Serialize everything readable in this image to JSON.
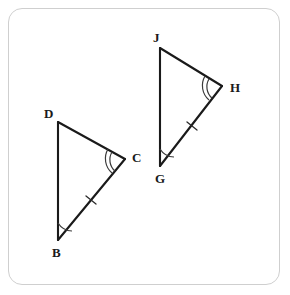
{
  "figure": {
    "name": "congruent-triangles-diagram",
    "border_color": "#cfcfcf",
    "line_color": "#1a1a1a",
    "background_color": "#ffffff",
    "triangles": [
      {
        "id": "triangle-bcd",
        "name": "Triangle BCD",
        "vertices": [
          {
            "label": "D",
            "x": 58,
            "y": 122,
            "label_x": 44,
            "label_y": 118
          },
          {
            "label": "C",
            "x": 125,
            "y": 159,
            "label_x": 132,
            "label_y": 162
          },
          {
            "label": "B",
            "x": 58,
            "y": 240,
            "label_x": 52,
            "label_y": 257
          }
        ],
        "sides": [
          {
            "id": "side-dc",
            "from": "D",
            "to": "C",
            "ticks": 0
          },
          {
            "id": "side-cb",
            "from": "C",
            "to": "B",
            "ticks": 1
          },
          {
            "id": "side-bd",
            "from": "B",
            "to": "D",
            "ticks": 0
          }
        ],
        "angles": [
          {
            "id": "angle-c",
            "vertex": "C",
            "arcs": 2
          },
          {
            "id": "angle-b",
            "vertex": "B",
            "arcs": 1
          }
        ]
      },
      {
        "id": "triangle-ghj",
        "name": "Triangle GHJ",
        "vertices": [
          {
            "label": "J",
            "x": 160,
            "y": 48,
            "label_x": 153,
            "label_y": 42
          },
          {
            "label": "H",
            "x": 222,
            "y": 86,
            "label_x": 230,
            "label_y": 92
          },
          {
            "label": "G",
            "x": 160,
            "y": 166,
            "label_x": 155,
            "label_y": 183
          }
        ],
        "sides": [
          {
            "id": "side-jh",
            "from": "J",
            "to": "H",
            "ticks": 0
          },
          {
            "id": "side-hg",
            "from": "H",
            "to": "G",
            "ticks": 1
          },
          {
            "id": "side-gj",
            "from": "G",
            "to": "J",
            "ticks": 0
          }
        ],
        "angles": [
          {
            "id": "angle-h",
            "vertex": "H",
            "arcs": 2
          },
          {
            "id": "angle-g",
            "vertex": "G",
            "arcs": 1
          }
        ]
      }
    ],
    "labels": {
      "d": "D",
      "c": "C",
      "b": "B",
      "j": "J",
      "h": "H",
      "g": "G"
    }
  }
}
